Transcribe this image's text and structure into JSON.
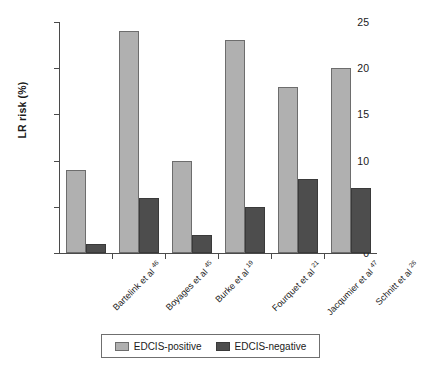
{
  "chart_data": {
    "type": "bar",
    "title": "",
    "xlabel": "",
    "ylabel": "LR risk (%)",
    "ylim": [
      0,
      25
    ],
    "yticks": [
      0,
      5,
      10,
      15,
      20,
      25
    ],
    "ytick_labels": [
      "0",
      "5",
      "10",
      "15",
      "20",
      "25"
    ],
    "grid": false,
    "legend_position": "bottom-center",
    "categories": [
      "Bartelink et al",
      "Boyages et al",
      "Burke et al",
      "Fourquet et al",
      "Jacqumier et al",
      "Schnitt et al"
    ],
    "category_refs": [
      "46",
      "45",
      "19",
      "21",
      "47",
      "26"
    ],
    "series": [
      {
        "name": "EDCIS-positive",
        "color": "#b0b0b0",
        "values": [
          9,
          24,
          10,
          23,
          18,
          20
        ]
      },
      {
        "name": "EDCIS-negative",
        "color": "#4d4d4d",
        "values": [
          1,
          6,
          2,
          5,
          8,
          7
        ]
      }
    ]
  }
}
